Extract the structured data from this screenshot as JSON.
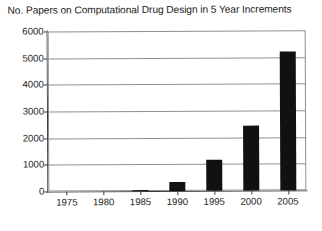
{
  "chart_data": {
    "type": "bar",
    "title": "No. Papers on Computational Drug Design in 5 Year Increments",
    "xlabel": "",
    "ylabel": "",
    "categories": [
      "1975",
      "1980",
      "1985",
      "1990",
      "1995",
      "2000",
      "2005"
    ],
    "values": [
      0,
      0,
      50,
      330,
      1150,
      2450,
      5200
    ],
    "ylim": [
      0,
      6000
    ],
    "ytick_labels": [
      "0",
      "1000",
      "2000",
      "3000",
      "4000",
      "5000",
      "6000"
    ],
    "ytick_values": [
      0,
      1000,
      2000,
      3000,
      4000,
      5000,
      6000
    ],
    "xtick_labels": [
      "1975",
      "1980",
      "1985",
      "1990",
      "1995",
      "2000",
      "2005"
    ],
    "grid": true,
    "grid_axis": "y",
    "legend": false,
    "legend_position": "none",
    "bar_color": "#111111",
    "grid_color": "#8f8f8f",
    "axis_color": "#3a3a3a",
    "background_color": "#ffffff"
  }
}
